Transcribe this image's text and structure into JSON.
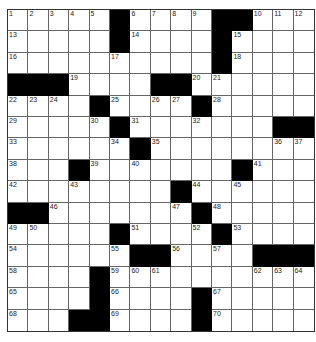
{
  "puzzle": {
    "size": [
      15,
      15
    ],
    "rows": [
      [
        "1",
        "2",
        "3",
        "4",
        "5",
        "#",
        "6",
        "7",
        "8",
        "9",
        "#",
        "#",
        "10",
        "11",
        "12"
      ],
      [
        "13",
        "",
        "",
        "",
        "",
        "#",
        "14",
        "",
        "",
        "",
        "#",
        "15",
        "",
        "",
        ""
      ],
      [
        "16",
        "",
        "",
        "",
        "",
        "17",
        "",
        "",
        "",
        "",
        "#",
        "18",
        "",
        "",
        ""
      ],
      [
        "#",
        "#",
        "#",
        "19",
        "",
        "",
        "",
        "#",
        "#",
        "20",
        "21",
        "",
        "",
        "",
        ""
      ],
      [
        "22",
        "23",
        "24",
        "",
        "#",
        "25",
        "",
        "26",
        "27",
        "#",
        "28",
        "",
        "",
        "",
        ""
      ],
      [
        "29",
        "",
        "",
        "",
        "30",
        "#",
        "31",
        "",
        "",
        "32",
        "",
        "",
        "",
        "#",
        "#"
      ],
      [
        "33",
        "",
        "",
        "",
        "",
        "34",
        "#",
        "35",
        "",
        "",
        "",
        "",
        "",
        "36",
        "37"
      ],
      [
        "38",
        "",
        "",
        "#",
        "39",
        "",
        "40",
        "",
        "",
        "",
        "",
        "#",
        "41",
        "",
        ""
      ],
      [
        "42",
        "",
        "",
        "43",
        "",
        "",
        "",
        "",
        "#",
        "44",
        "",
        "45",
        "",
        "",
        ""
      ],
      [
        "#",
        "#",
        "46",
        "",
        "",
        "",
        "",
        "",
        "47",
        "#",
        "48",
        "",
        "",
        "",
        ""
      ],
      [
        "49",
        "50",
        "",
        "",
        "",
        "#",
        "51",
        "",
        "",
        "52",
        "#",
        "53",
        "",
        "",
        ""
      ],
      [
        "54",
        "",
        "",
        "",
        "",
        "55",
        "#",
        "#",
        "56",
        "",
        "57",
        "",
        "#",
        "#",
        "#"
      ],
      [
        "58",
        "",
        "",
        "",
        "#",
        "59",
        "60",
        "61",
        "",
        "",
        "",
        "",
        "62",
        "63",
        "64"
      ],
      [
        "65",
        "",
        "",
        "",
        "#",
        "66",
        "",
        "",
        "",
        "#",
        "67",
        "",
        "",
        "",
        ""
      ],
      [
        "68",
        "",
        "",
        "#",
        "#",
        "69",
        "",
        "",
        "",
        "#",
        "70",
        "",
        "",
        "",
        ""
      ]
    ]
  }
}
